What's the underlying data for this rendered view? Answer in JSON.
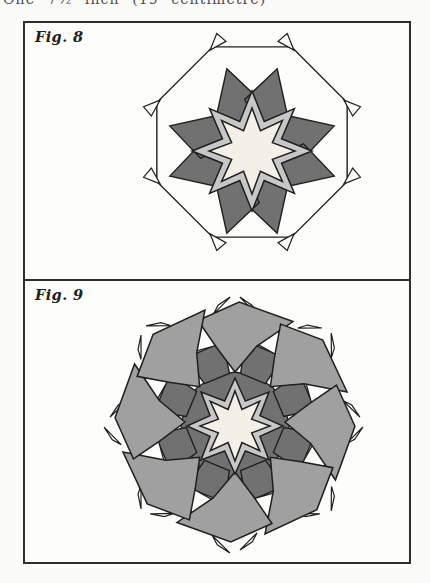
{
  "page": {
    "top_caption": "One 7½ inch (19 centimetre)"
  },
  "palette": {
    "page_bg": "#fbfbf9",
    "paper": "#fdfdfb",
    "outline": "#1f1f1f",
    "dark": "#717171",
    "mid": "#a0a0a0",
    "light": "#c7c7c7",
    "cream": "#f3f1e7"
  },
  "figures": [
    {
      "id": "fig8",
      "label": "Fig. 8",
      "kind": "octagon-framed-eight-point-star",
      "geometry": {
        "octagon_radius": 103,
        "octagon_rotation": 22.5,
        "corner_flap_length": 11,
        "star_cluster_offset_y": 9,
        "dark_point_pairs": {
          "cardinal_offset": 17,
          "tip_radius": 86,
          "half_width_deg": 25,
          "shoulder_radius": 52,
          "base_radius": 22
        },
        "dark_base_radius": 48,
        "light_star": {
          "points": 8,
          "outer": 60,
          "inner": 32
        },
        "center_star": {
          "points": 8,
          "outer": 43,
          "inner": 22
        }
      }
    },
    {
      "id": "fig9",
      "label": "Fig. 9",
      "kind": "pinwheel-rosette",
      "geometry": {
        "wing_count": 8,
        "wing_profile": [
          [
            -20,
            108
          ],
          [
            2,
            120
          ],
          [
            30,
            116
          ],
          [
            16,
            79
          ],
          [
            0,
            50
          ],
          [
            -14,
            77
          ]
        ],
        "square_profile": [
          [
            -9,
            103
          ],
          [
            9,
            100
          ],
          [
            11,
            79
          ],
          [
            -9,
            82
          ]
        ],
        "dark_wedge_profile": [
          [
            -15,
            81
          ],
          [
            14,
            81
          ],
          [
            16,
            49
          ],
          [
            -16,
            49
          ]
        ],
        "ring_angle_offset": 22.5,
        "dark_base_radius": 54,
        "flap_count": 16,
        "flap_base_radius": 110,
        "star_cluster_offset_y": 4,
        "light_star": {
          "points": 8,
          "outer": 48,
          "inner": 27
        },
        "center_star": {
          "points": 8,
          "outer": 35,
          "inner": 18
        }
      }
    }
  ]
}
